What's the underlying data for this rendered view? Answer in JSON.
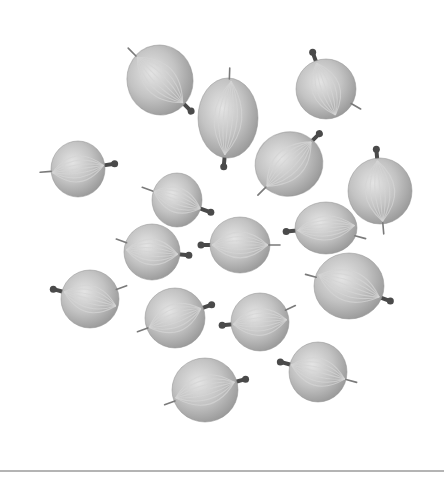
{
  "image": {
    "subject": "gooseberries",
    "description": "Grayscale photograph of 18 gooseberries scattered on a white background",
    "background_color": "#ffffff",
    "berry_fill": "#b9b9b9",
    "berry_highlight": "#e6e6e6",
    "berry_shadow": "#8f8f8f",
    "vein_color": "#d4d4d4",
    "stem_color": "#4a4a4a",
    "rule_color": "#b4b4b4"
  },
  "berries": [
    {
      "cx": 160,
      "cy": 80,
      "rx": 33,
      "ry": 35,
      "rot": -10,
      "stem_angle": 55,
      "tip_angle": -125
    },
    {
      "cx": 228,
      "cy": 118,
      "rx": 30,
      "ry": 40,
      "rot": 0,
      "stem_angle": 95,
      "tip_angle": -88
    },
    {
      "cx": 326,
      "cy": 89,
      "rx": 30,
      "ry": 30,
      "rot": 0,
      "stem_angle": -110,
      "tip_angle": 30
    },
    {
      "cx": 78,
      "cy": 169,
      "rx": 27,
      "ry": 28,
      "rot": 0,
      "stem_angle": -8,
      "tip_angle": 175
    },
    {
      "cx": 289,
      "cy": 164,
      "rx": 34,
      "ry": 32,
      "rot": -15,
      "stem_angle": -30,
      "tip_angle": 150
    },
    {
      "cx": 380,
      "cy": 191,
      "rx": 32,
      "ry": 33,
      "rot": 0,
      "stem_angle": -95,
      "tip_angle": 85
    },
    {
      "cx": 177,
      "cy": 200,
      "rx": 25,
      "ry": 27,
      "rot": 0,
      "stem_angle": 20,
      "tip_angle": 200
    },
    {
      "cx": 152,
      "cy": 252,
      "rx": 28,
      "ry": 28,
      "rot": 0,
      "stem_angle": 5,
      "tip_angle": 200
    },
    {
      "cx": 240,
      "cy": 245,
      "rx": 30,
      "ry": 28,
      "rot": 0,
      "stem_angle": 180,
      "tip_angle": 0
    },
    {
      "cx": 326,
      "cy": 228,
      "rx": 31,
      "ry": 26,
      "rot": 0,
      "stem_angle": 175,
      "tip_angle": 15
    },
    {
      "cx": 90,
      "cy": 299,
      "rx": 29,
      "ry": 29,
      "rot": 0,
      "stem_angle": 195,
      "tip_angle": -20
    },
    {
      "cx": 175,
      "cy": 318,
      "rx": 30,
      "ry": 30,
      "rot": 0,
      "stem_angle": -20,
      "tip_angle": 160
    },
    {
      "cx": 349,
      "cy": 286,
      "rx": 35,
      "ry": 33,
      "rot": 0,
      "stem_angle": 20,
      "tip_angle": 195
    },
    {
      "cx": 260,
      "cy": 322,
      "rx": 29,
      "ry": 29,
      "rot": 0,
      "stem_angle": 175,
      "tip_angle": -25
    },
    {
      "cx": 205,
      "cy": 390,
      "rx": 33,
      "ry": 32,
      "rot": 0,
      "stem_angle": -15,
      "tip_angle": 160
    },
    {
      "cx": 318,
      "cy": 372,
      "rx": 29,
      "ry": 30,
      "rot": 0,
      "stem_angle": 195,
      "tip_angle": 15
    },
    {
      "cx": 152,
      "cy": 268,
      "rx": 0,
      "ry": 0,
      "rot": 0,
      "stem_angle": 0,
      "tip_angle": 0,
      "hidden": true
    },
    {
      "cx": 230,
      "cy": 320,
      "rx": 0,
      "ry": 0,
      "rot": 0,
      "stem_angle": 0,
      "tip_angle": 0,
      "hidden": true
    }
  ],
  "rule": {
    "y": 470,
    "height": 2
  },
  "accessibility": {
    "caption": "Gooseberries on white background"
  }
}
